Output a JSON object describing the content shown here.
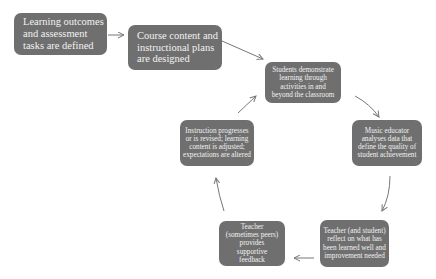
{
  "diagram": {
    "type": "cycle-flowchart",
    "box_color": "#6f6f6f",
    "text_color": "#f2f2f2",
    "arrow_color": "#777777",
    "nodes": [
      {
        "id": "n1",
        "label": "Learning outcomes and assessment tasks are defined"
      },
      {
        "id": "n2",
        "label": "Course content and instructional plans are designed"
      },
      {
        "id": "n3",
        "label": "Students demonstrate learning through activities in and beyond the classroom"
      },
      {
        "id": "n4",
        "label": "Music educator analyses data that define the quality of student achievement"
      },
      {
        "id": "n5",
        "label": "Teacher (and student) reflect on what has been learned well and improvement needed"
      },
      {
        "id": "n6",
        "label": "Teacher (sometimes peers) provides supportive feedback"
      },
      {
        "id": "n7",
        "label": "Instruction progresses or is revised; learning content is adjusted; expectations are altered"
      }
    ],
    "edges": [
      {
        "from": "n1",
        "to": "n2"
      },
      {
        "from": "n2",
        "to": "n3"
      },
      {
        "from": "n3",
        "to": "n4"
      },
      {
        "from": "n4",
        "to": "n5"
      },
      {
        "from": "n5",
        "to": "n6"
      },
      {
        "from": "n6",
        "to": "n7"
      },
      {
        "from": "n7",
        "to": "n3"
      }
    ]
  }
}
